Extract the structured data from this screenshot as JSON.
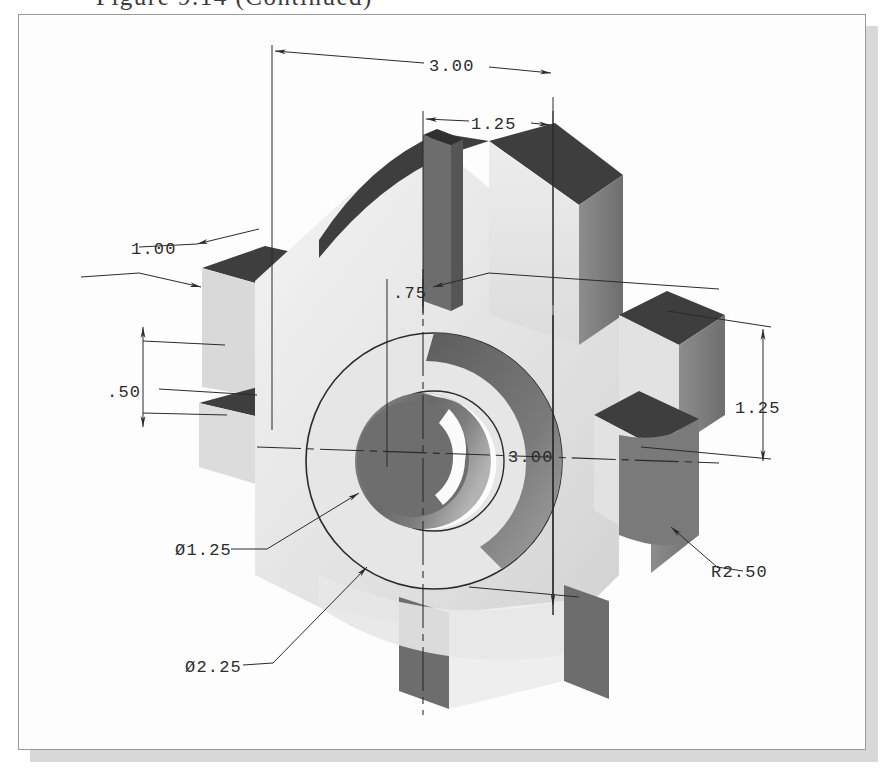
{
  "caption": {
    "text": "Figure 9.14  (Continued)"
  },
  "drawing": {
    "title": "Isometric pictorial of a four-lobed hub with central bore",
    "projection": "isometric",
    "units": "inches",
    "background_color": "#fdfdfd",
    "line_color": "#2b2b2b",
    "shading": {
      "top_face": "#3f3f3f",
      "front_face": "#e2e2e2",
      "right_face": "#7d7d7d",
      "slot_face": "#6b6b6b",
      "bore_face": "#6f6f6f",
      "highlight": "#f2f2f2"
    },
    "dimensions": [
      {
        "id": "overall-width",
        "label": "3.00",
        "kind": "linear",
        "orientation": "top-horizontal",
        "value": 3.0,
        "x": 438,
        "y": 62
      },
      {
        "id": "lobe-width-top",
        "label": "1.25",
        "kind": "linear",
        "orientation": "top-horizontal",
        "value": 1.25,
        "x": 500,
        "y": 118
      },
      {
        "id": "lobe-thickness-left",
        "label": "1.00",
        "kind": "linear",
        "orientation": "leader-left",
        "value": 1.0,
        "x": 150,
        "y": 247
      },
      {
        "id": "hub-projection",
        "label": ".75",
        "kind": "linear",
        "orientation": "leader-center",
        "value": 0.75,
        "x": 401,
        "y": 289
      },
      {
        "id": "lobe-height-left",
        "label": ".50",
        "kind": "linear",
        "orientation": "left-vertical",
        "value": 0.5,
        "x": 130,
        "y": 392
      },
      {
        "id": "overall-depth",
        "label": "3.00",
        "kind": "linear",
        "orientation": "center-vertical",
        "value": 3.0,
        "x": 525,
        "y": 455
      },
      {
        "id": "lobe-width-right",
        "label": "1.25",
        "kind": "linear",
        "orientation": "right-vertical",
        "value": 1.25,
        "x": 752,
        "y": 406
      },
      {
        "id": "bore-diameter",
        "label": "Ø1.25",
        "kind": "diameter",
        "orientation": "leader",
        "value": 1.25,
        "x": 192,
        "y": 549
      },
      {
        "id": "hub-diameter",
        "label": "Ø2.25",
        "kind": "diameter",
        "orientation": "leader",
        "value": 2.25,
        "x": 205,
        "y": 663
      },
      {
        "id": "lobe-radius",
        "label": "R2.50",
        "kind": "radius",
        "orientation": "leader",
        "value": 2.5,
        "x": 727,
        "y": 570
      }
    ]
  }
}
